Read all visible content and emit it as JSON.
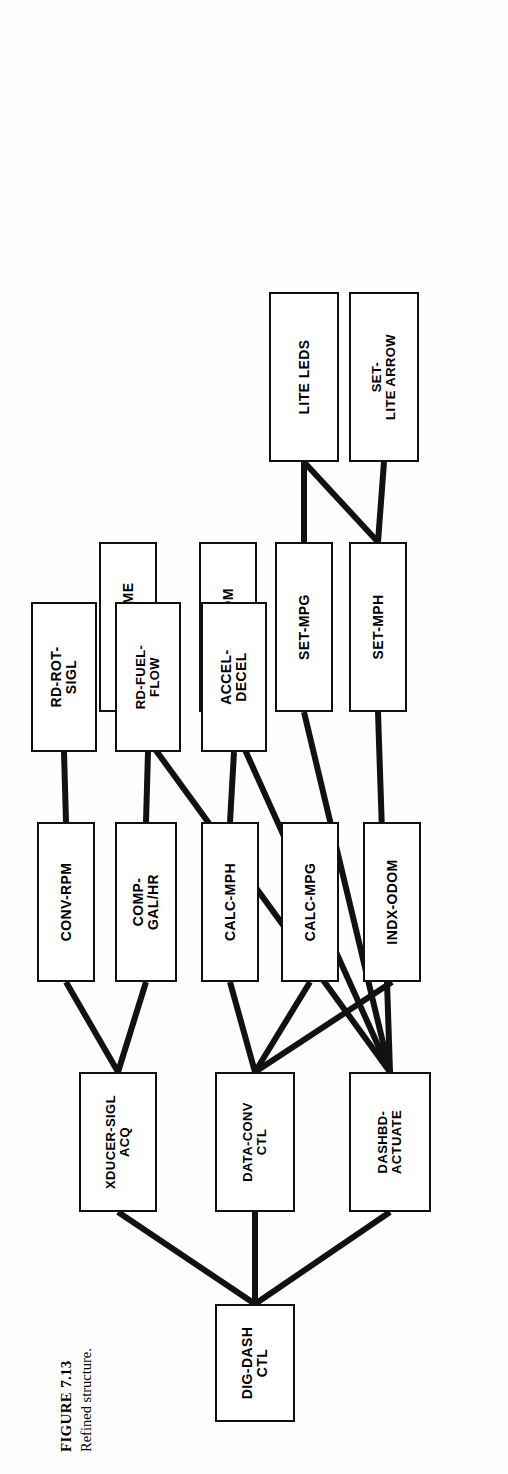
{
  "figure": {
    "number": "FIGURE 7.13",
    "caption": "Refined structure."
  },
  "diagram": {
    "type": "structure-chart",
    "orientation": "rotated-90-ccw-on-page",
    "nodes": [
      {
        "id": "root",
        "label": "DIG-DASH\nCTL",
        "x": 30,
        "y": 196,
        "w": 118,
        "h": 80
      },
      {
        "id": "xducer",
        "label": "XDUCER-SIGL\nACQ",
        "x": 240,
        "y": 60,
        "w": 140,
        "h": 78
      },
      {
        "id": "dataconv",
        "label": "DATA-CONV\nCTL",
        "x": 240,
        "y": 196,
        "w": 140,
        "h": 80
      },
      {
        "id": "dashbd",
        "label": "DASHBD-\nACTUATE",
        "x": 240,
        "y": 330,
        "w": 140,
        "h": 82
      },
      {
        "id": "convrpm",
        "label": "CONV-RPM",
        "x": 470,
        "y": 18,
        "w": 160,
        "h": 58
      },
      {
        "id": "compgal",
        "label": "COMP-\nGAL/HR",
        "x": 470,
        "y": 96,
        "w": 160,
        "h": 62
      },
      {
        "id": "calcmph",
        "label": "CALC-MPH",
        "x": 470,
        "y": 182,
        "w": 160,
        "h": 58
      },
      {
        "id": "calcmpg",
        "label": "CALC-MPG",
        "x": 470,
        "y": 262,
        "w": 160,
        "h": 58
      },
      {
        "id": "indxodom",
        "label": "INDX-ODOM",
        "x": 470,
        "y": 344,
        "w": 160,
        "h": 58
      },
      {
        "id": "setmph",
        "label": "SET-MPH",
        "x": 740,
        "y": 330,
        "w": 170,
        "h": 58
      },
      {
        "id": "setmpg",
        "label": "SET-MPG",
        "x": 740,
        "y": 256,
        "w": 170,
        "h": 58
      },
      {
        "id": "setodom",
        "label": "SET-ODOM",
        "x": 740,
        "y": 180,
        "w": 170,
        "h": 58
      },
      {
        "id": "ringchime",
        "label": "RING-CHIME",
        "x": 740,
        "y": 80,
        "w": 170,
        "h": 58
      },
      {
        "id": "rdrot",
        "label": "RD-ROT-\nSIGL",
        "x": 700,
        "y": 12,
        "w": 150,
        "h": 66
      },
      {
        "id": "rdfuel",
        "label": "RD-FUEL-\nFLOW",
        "x": 700,
        "y": 96,
        "w": 150,
        "h": 66
      },
      {
        "id": "acceldecel",
        "label": "ACCEL-\nDECEL",
        "x": 700,
        "y": 182,
        "w": 150,
        "h": 66
      },
      {
        "id": "setlitearrow",
        "label": "SET-\nLITE ARROW",
        "x": 990,
        "y": 330,
        "w": 170,
        "h": 70
      },
      {
        "id": "liteleds",
        "label": "LITE LEDS",
        "x": 990,
        "y": 250,
        "w": 170,
        "h": 70
      }
    ],
    "edges": [
      {
        "from": "root",
        "to": "xducer"
      },
      {
        "from": "root",
        "to": "dataconv"
      },
      {
        "from": "root",
        "to": "dashbd"
      },
      {
        "from": "xducer",
        "to": "convrpm"
      },
      {
        "from": "xducer",
        "to": "compgal"
      },
      {
        "from": "dataconv",
        "to": "calcmph"
      },
      {
        "from": "dataconv",
        "to": "calcmpg"
      },
      {
        "from": "dataconv",
        "to": "indxodom"
      },
      {
        "from": "dashbd",
        "to": "setmph"
      },
      {
        "from": "dashbd",
        "to": "setmpg"
      },
      {
        "from": "dashbd",
        "to": "setodom"
      },
      {
        "from": "dashbd",
        "to": "ringchime"
      },
      {
        "from": "convrpm",
        "to": "rdrot"
      },
      {
        "from": "compgal",
        "to": "rdfuel"
      },
      {
        "from": "calcmph",
        "to": "acceldecel"
      },
      {
        "from": "setmph",
        "to": "setlitearrow"
      },
      {
        "from": "setmph",
        "to": "liteleds"
      },
      {
        "from": "setmpg",
        "to": "liteleds"
      }
    ]
  }
}
